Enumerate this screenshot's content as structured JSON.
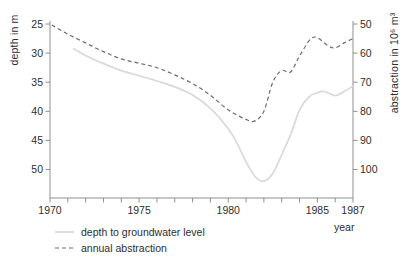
{
  "chart_data": {
    "type": "line",
    "title": "",
    "x_axis": {
      "label": "year",
      "range": [
        1970,
        1987
      ],
      "minor_tick_every": 1,
      "labeled_ticks": [
        1970,
        1975,
        1980,
        1985,
        1987
      ]
    },
    "left_axis": {
      "label": "depth in m",
      "ticks": [
        25,
        30,
        35,
        40,
        45,
        50
      ],
      "top_value": 25,
      "increases": "downward"
    },
    "right_axis": {
      "label": "abstraction in 10⁶ m³",
      "ticks": [
        50,
        60,
        70,
        80,
        90,
        100
      ],
      "top_value": 50,
      "increases": "downward"
    },
    "grid": "off",
    "legend_position": "bottom-left",
    "series": [
      {
        "name": "depth to groundwater level",
        "axis": "left",
        "line_style": "solid",
        "color": "#d9d9d9",
        "points": [
          [
            1971.3,
            29.2
          ],
          [
            1972,
            30.4
          ],
          [
            1973,
            31.8
          ],
          [
            1974,
            33.0
          ],
          [
            1975,
            33.9
          ],
          [
            1976,
            34.8
          ],
          [
            1977,
            35.8
          ],
          [
            1978,
            37.2
          ],
          [
            1979,
            39.5
          ],
          [
            1980,
            43.0
          ],
          [
            1980.5,
            45.5
          ],
          [
            1981,
            48.7
          ],
          [
            1981.5,
            51.2
          ],
          [
            1982,
            52.0
          ],
          [
            1982.5,
            50.7
          ],
          [
            1983,
            47.5
          ],
          [
            1983.5,
            44.0
          ],
          [
            1984,
            39.8
          ],
          [
            1984.5,
            37.6
          ],
          [
            1985,
            36.8
          ],
          [
            1985.4,
            36.6
          ],
          [
            1986,
            37.3
          ],
          [
            1986.5,
            36.6
          ],
          [
            1987,
            35.7
          ]
        ]
      },
      {
        "name": "annual abstraction",
        "axis": "right",
        "line_style": "dashed",
        "color": "#6b6b6b",
        "points": [
          [
            1970.1,
            50.3
          ],
          [
            1971,
            53.5
          ],
          [
            1972,
            56.5
          ],
          [
            1973,
            59.5
          ],
          [
            1974,
            62.0
          ],
          [
            1975,
            63.5
          ],
          [
            1976,
            65.0
          ],
          [
            1977,
            67.5
          ],
          [
            1978,
            70.5
          ],
          [
            1979,
            74.5
          ],
          [
            1980,
            79.5
          ],
          [
            1981,
            82.8
          ],
          [
            1981.5,
            83.3
          ],
          [
            1982,
            80.0
          ],
          [
            1982.5,
            70.0
          ],
          [
            1983,
            66.0
          ],
          [
            1983.5,
            66.5
          ],
          [
            1984,
            61.0
          ],
          [
            1984.6,
            55.3
          ],
          [
            1985,
            54.7
          ],
          [
            1985.6,
            57.5
          ],
          [
            1986,
            58.2
          ],
          [
            1986.5,
            56.5
          ],
          [
            1987,
            55.0
          ]
        ]
      }
    ]
  },
  "colors": {
    "background": "#ffffff",
    "axis": "#8f8f8f",
    "text": "#2e2e2e",
    "depth_line": "#d9d9d9",
    "abstraction_line": "#6b6b6b"
  }
}
